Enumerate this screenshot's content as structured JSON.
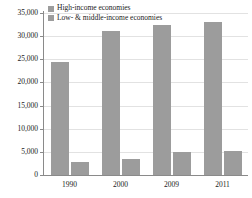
{
  "chart_data": {
    "type": "bar",
    "title": "",
    "subtitle": "",
    "xlabel": "",
    "ylabel": "",
    "categories": [
      "1990",
      "2000",
      "2009",
      "2011"
    ],
    "series": [
      {
        "name": "High-income economies",
        "color": "#9c9c9c",
        "values": [
          24500,
          31100,
          32400,
          33100
        ]
      },
      {
        "name": "Low- & middle-income economies",
        "color": "#9c9c9c",
        "values": [
          2800,
          3500,
          5000,
          5200
        ]
      }
    ],
    "ylim": [
      0,
      35000
    ],
    "yticks": [
      0,
      5000,
      10000,
      15000,
      20000,
      25000,
      30000,
      35000
    ],
    "ytick_labels": [
      "0",
      "5,000",
      "10,000",
      "15,000",
      "20,000",
      "25,000",
      "30,000",
      "35,000"
    ],
    "grid": true,
    "legend_position": "top-left"
  },
  "legend": {
    "items": [
      {
        "label": "High-income economies",
        "swatch_name": "high-income-swatch"
      },
      {
        "label": "Low- & middle-income economies",
        "swatch_name": "low-middle-income-swatch"
      }
    ]
  }
}
